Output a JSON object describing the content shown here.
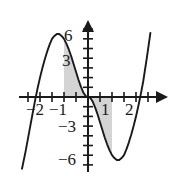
{
  "figure": {
    "name": "cubic-curve-with-shaded-area",
    "background_color": "#ffffff",
    "curve_color": "#1a1a1a",
    "axis_color": "#1a1a1a",
    "shade_color": "#d4d4d4"
  },
  "axes": {
    "x_ticks_labeled": [
      "-2",
      "-1",
      "1",
      "2"
    ],
    "y_ticks_labeled": [
      "6",
      "3",
      "-3",
      "-6"
    ],
    "x_label": "",
    "y_label": ""
  },
  "labels": {
    "y_6": "6",
    "y_3": "3",
    "y_neg3": "−3",
    "y_neg6": "−6",
    "x_neg2": "−2",
    "x_neg1": "−1",
    "x_1": "1",
    "x_2": "2"
  },
  "chart_data": {
    "type": "line",
    "title": "",
    "xlabel": "",
    "ylabel": "",
    "xlim": [
      -2.9,
      2.7
    ],
    "ylim": [
      -7.6,
      7.2
    ],
    "grid": false,
    "legend": "none",
    "x_tick_labels": [
      "-2",
      "-1",
      "1",
      "2"
    ],
    "x_tick_values": [
      -2,
      -1,
      1,
      2
    ],
    "x_minor_tick_step": 0.5,
    "y_tick_labels": [
      "6",
      "3",
      "-3",
      "-6"
    ],
    "y_tick_values": [
      6,
      3,
      -3,
      -6
    ],
    "y_minor_tick_step": 1,
    "series": [
      {
        "name": "cubic",
        "x": [
          -2.75,
          -2.6,
          -2.45,
          -2.3,
          -2.2,
          -2.1,
          -2.0,
          -1.9,
          -1.8,
          -1.7,
          -1.6,
          -1.5,
          -1.4,
          -1.3,
          -1.2,
          -1.1,
          -1.0,
          -0.9,
          -0.8,
          -0.7,
          -0.6,
          -0.5,
          -0.4,
          -0.3,
          -0.2,
          -0.1,
          0.0,
          0.1,
          0.2,
          0.3,
          0.4,
          0.5,
          0.6,
          0.7,
          0.8,
          0.9,
          1.0,
          1.1,
          1.2,
          1.3,
          1.4,
          1.5,
          1.6,
          1.7,
          1.8,
          1.9,
          2.0,
          2.1,
          2.2,
          2.3,
          2.45,
          2.6
        ],
        "y": [
          -7.4,
          -5.6,
          -3.6,
          -1.6,
          -0.3,
          0.9,
          2.0,
          3.0,
          3.9,
          4.7,
          5.4,
          6.0,
          6.3,
          6.5,
          6.5,
          6.3,
          6.0,
          5.5,
          4.9,
          4.2,
          3.4,
          2.6,
          1.8,
          1.1,
          0.5,
          0.1,
          0.0,
          -0.1,
          -0.5,
          -1.1,
          -1.8,
          -2.6,
          -3.4,
          -4.2,
          -4.9,
          -5.5,
          -6.0,
          -6.3,
          -6.5,
          -6.5,
          -6.3,
          -6.0,
          -5.4,
          -4.7,
          -3.9,
          -3.0,
          -2.0,
          -0.9,
          0.3,
          1.6,
          4.0,
          6.6
        ]
      }
    ],
    "shaded_regions": [
      {
        "name": "positive-area",
        "x_from": -1.0,
        "x_to": 0.0,
        "side": "above-axis",
        "fill": "#d4d4d4"
      },
      {
        "name": "negative-area",
        "x_from": 0.0,
        "x_to": 1.0,
        "side": "below-axis",
        "fill": "#d4d4d4"
      }
    ]
  }
}
